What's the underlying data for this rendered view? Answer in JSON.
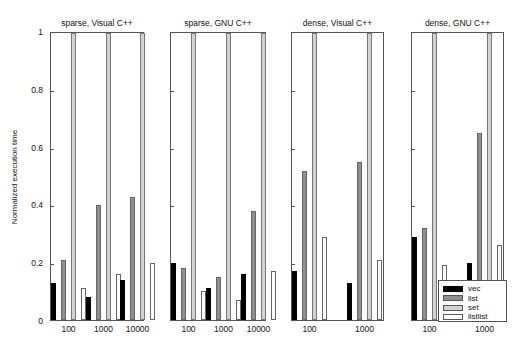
{
  "chart_data": {
    "type": "bar",
    "ylabel": "Normalized execution time",
    "ylim": [
      0,
      1
    ],
    "yticks": [
      "0",
      "0.2",
      "0.4",
      "0.6",
      "0.8",
      "1"
    ],
    "legend": [
      "vec",
      "list",
      "set",
      "listlist"
    ],
    "legend_position": "lower right (last panel)",
    "grid": false,
    "series_colors": {
      "vec": "#000000",
      "list": "#8f8f8f",
      "set": "#d2d2d2",
      "listlist": "#ffffff"
    },
    "panels": [
      {
        "title": "sparse, Visual C++",
        "categories": [
          "100",
          "1000",
          "10000"
        ],
        "series": [
          {
            "name": "vec",
            "values": [
              0.13,
              0.08,
              0.14
            ]
          },
          {
            "name": "list",
            "values": [
              0.21,
              0.4,
              0.43
            ]
          },
          {
            "name": "set",
            "values": [
              1.0,
              1.0,
              1.0
            ]
          },
          {
            "name": "listlist",
            "values": [
              0.11,
              0.16,
              0.2
            ]
          }
        ]
      },
      {
        "title": "sparse, GNU C++",
        "categories": [
          "100",
          "1000",
          "10000"
        ],
        "series": [
          {
            "name": "vec",
            "values": [
              0.2,
              0.11,
              0.16
            ]
          },
          {
            "name": "list",
            "values": [
              0.18,
              0.15,
              0.38
            ]
          },
          {
            "name": "set",
            "values": [
              1.0,
              1.0,
              1.0
            ]
          },
          {
            "name": "listlist",
            "values": [
              0.1,
              0.07,
              0.17
            ]
          }
        ]
      },
      {
        "title": "dense, Visual C++",
        "categories": [
          "100",
          "1000"
        ],
        "series": [
          {
            "name": "vec",
            "values": [
              0.17,
              0.13
            ]
          },
          {
            "name": "list",
            "values": [
              0.52,
              0.55
            ]
          },
          {
            "name": "set",
            "values": [
              1.0,
              1.0
            ]
          },
          {
            "name": "listlist",
            "values": [
              0.29,
              0.21
            ]
          }
        ]
      },
      {
        "title": "dense, GNU C++",
        "categories": [
          "100",
          "1000"
        ],
        "series": [
          {
            "name": "vec",
            "values": [
              0.29,
              0.2
            ]
          },
          {
            "name": "list",
            "values": [
              0.32,
              0.65
            ]
          },
          {
            "name": "set",
            "values": [
              1.0,
              1.0
            ]
          },
          {
            "name": "listlist",
            "values": [
              0.19,
              0.26
            ]
          }
        ]
      }
    ]
  }
}
